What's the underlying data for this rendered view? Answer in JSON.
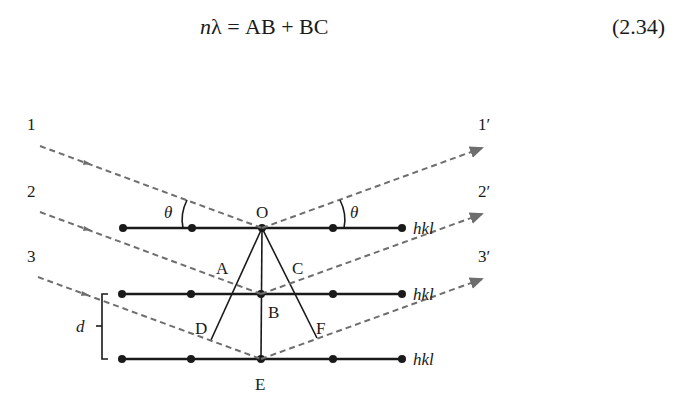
{
  "equation": {
    "lhs_var": "n",
    "lhs_symbol": "λ",
    "equals": "=",
    "rhs": "AB + BC",
    "number": "(2.34)"
  },
  "diagram": {
    "incident_rays": [
      {
        "label": "1",
        "x": 30,
        "y": 124,
        "x1": 40,
        "y1": 146,
        "x2": 262,
        "y2": 228
      },
      {
        "label": "2",
        "x": 30,
        "y": 191,
        "x1": 40,
        "y1": 212,
        "x2": 261,
        "y2": 294
      },
      {
        "label": "3",
        "x": 30,
        "y": 256,
        "x1": 38,
        "y1": 277,
        "x2": 261,
        "y2": 359
      }
    ],
    "reflected_rays": [
      {
        "label": "1′",
        "x": 478,
        "y": 124,
        "x1": 262,
        "y1": 228,
        "x2": 486,
        "y2": 147
      },
      {
        "label": "2′",
        "x": 478,
        "y": 191,
        "x1": 261,
        "y1": 294,
        "x2": 486,
        "y2": 213
      },
      {
        "label": "3′",
        "x": 478,
        "y": 256,
        "x1": 261,
        "y1": 359,
        "x2": 486,
        "y2": 278
      }
    ],
    "planes": [
      {
        "label": "hkl",
        "y": 228,
        "atoms_x": [
          123,
          192,
          262,
          333,
          402
        ]
      },
      {
        "label": "hkl",
        "y": 294,
        "atoms_x": [
          122,
          191,
          261,
          333,
          402
        ]
      },
      {
        "label": "hkl",
        "y": 359,
        "atoms_x": [
          122,
          191,
          261,
          333,
          402
        ]
      }
    ],
    "points": {
      "O": {
        "label": "O",
        "x": 262,
        "y": 212
      },
      "A": {
        "label": "A",
        "x": 222,
        "y": 270
      },
      "B": {
        "label": "B",
        "x": 274,
        "y": 316
      },
      "C": {
        "label": "C",
        "x": 298,
        "y": 270
      },
      "D": {
        "label": "D",
        "x": 201,
        "y": 330
      },
      "E": {
        "label": "E",
        "x": 261,
        "y": 387
      },
      "F": {
        "label": "F",
        "x": 322,
        "y": 330
      }
    },
    "angle_label": "θ",
    "spacing_label": "d",
    "plane_label": "hkl",
    "colors": {
      "ink": "#1a1a1a",
      "ray": "#6e6e6e",
      "background": "#ffffff"
    }
  }
}
